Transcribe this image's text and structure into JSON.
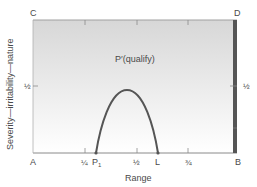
{
  "diagram": {
    "corners": {
      "top_left": "C",
      "top_right": "D",
      "bottom_left": "A",
      "bottom_right": "B"
    },
    "region_label": "P′(qualify)",
    "x_axis": {
      "label": "Range",
      "ticks": [
        "¼",
        "½",
        "¾"
      ],
      "points": {
        "start": "P₁",
        "end": "L"
      },
      "sub_p": "P",
      "sub_1": "1"
    },
    "y_axis": {
      "label": "Severity—irritability—nature",
      "tick_left": "½",
      "tick_right": "½"
    },
    "colors": {
      "gradient_top": "#d9d9d9",
      "gradient_bottom": "#ffffff",
      "curve": "#555555",
      "right_bar": "#555555",
      "frame": "#9a9a9a"
    }
  }
}
